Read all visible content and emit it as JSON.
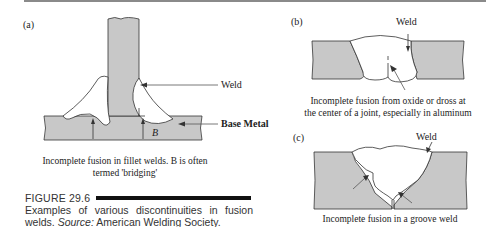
{
  "colors": {
    "metal_fill": "#c8c8c8",
    "outline": "#333333",
    "rule": "#8a8a8a",
    "text": "#222222"
  },
  "panels": {
    "a": {
      "tag": "(a)",
      "callouts": {
        "weld": "Weld",
        "base_metal": "Base Metal",
        "bridging": "B"
      },
      "caption_line1": "Incomplete fusion in fillet welds. B is often",
      "caption_line2": "termed 'bridging'"
    },
    "b": {
      "tag": "(b)",
      "callouts": {
        "weld": "Weld"
      },
      "caption_line1": "Incomplete fusion from oxide or dross at",
      "caption_line2": "the center of a joint, especially in aluminum"
    },
    "c": {
      "tag": "(c)",
      "callouts": {
        "weld": "Weld"
      },
      "caption_line1": "Incomplete  fusion in a groove weld"
    }
  },
  "figure": {
    "number": "FIGURE 29.6",
    "caption_main": "Examples of various discontinuities in fusion welds.",
    "caption_source_label": "Source:",
    "caption_source": "American Welding Society."
  }
}
